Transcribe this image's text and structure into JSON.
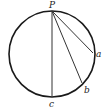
{
  "diagram": {
    "points": {
      "P": {
        "label": "P"
      },
      "a": {
        "label": "a"
      },
      "b": {
        "label": "b"
      },
      "c": {
        "label": "c"
      }
    },
    "chords": [
      {
        "from": "P",
        "to": "a"
      },
      {
        "from": "P",
        "to": "b"
      },
      {
        "from": "P",
        "to": "c"
      }
    ],
    "colors": {
      "stroke": "#1a1a1a",
      "text": "#222222",
      "background": "#ffffff"
    }
  }
}
